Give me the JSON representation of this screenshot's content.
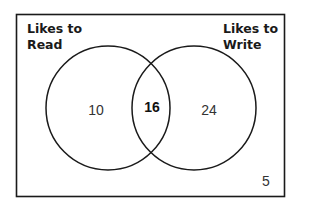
{
  "diagram": {
    "type": "venn",
    "sets": [
      {
        "name": "Likes to Read",
        "label_lines": [
          "Likes to",
          "Read"
        ],
        "only_count": "10"
      },
      {
        "name": "Likes to Write",
        "label_lines": [
          "Likes to",
          "Write"
        ],
        "only_count": "24"
      }
    ],
    "intersection_count": "16",
    "outside_count": "5",
    "colors": {
      "stroke": "#1a1a1a",
      "background": "#ffffff"
    }
  }
}
